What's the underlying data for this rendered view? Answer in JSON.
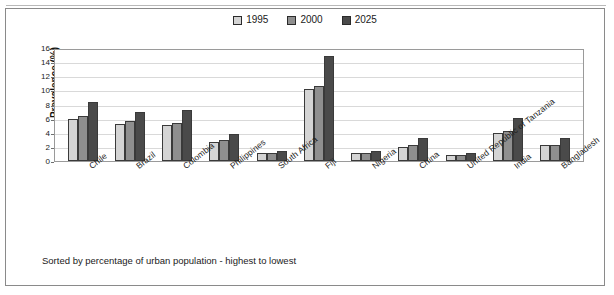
{
  "figure": {
    "caption": "Sorted by percentage of urban population - highest to lowest"
  },
  "legend": {
    "entries": [
      {
        "label": "1995",
        "color": "#d4d4d4"
      },
      {
        "label": "2000",
        "color": "#8f8f8f"
      },
      {
        "label": "2025",
        "color": "#4a4a4a"
      }
    ]
  },
  "chart_data": {
    "type": "bar",
    "title": "",
    "subtitle": "",
    "xlabel": "",
    "ylabel": "Prevalence (%)",
    "ylim": [
      0,
      16
    ],
    "ytick_step": 2,
    "yticks": [
      "0",
      "2",
      "4",
      "6",
      "8",
      "10",
      "12",
      "14",
      "16"
    ],
    "grid": true,
    "legend_position": "top-center",
    "annotations": [
      "Sorted by percentage of urban population - highest to lowest"
    ],
    "categories": [
      "Chile",
      "Brazil",
      "Colombia",
      "Philippines",
      "South Africa",
      "Fiji",
      "Nigeria",
      "China",
      "United Republic of Tanzania",
      "India",
      "Bangladesh"
    ],
    "series": [
      {
        "name": "1995",
        "color": "#d4d4d4",
        "values": [
          6.0,
          5.3,
          5.1,
          2.7,
          1.2,
          10.2,
          1.2,
          2.0,
          0.9,
          4.0,
          2.2
        ]
      },
      {
        "name": "2000",
        "color": "#8f8f8f",
        "values": [
          6.4,
          5.6,
          5.4,
          3.0,
          1.2,
          10.6,
          1.2,
          2.3,
          0.9,
          4.2,
          2.3
        ]
      },
      {
        "name": "2025",
        "color": "#4a4a4a",
        "values": [
          8.3,
          7.0,
          7.2,
          3.8,
          1.4,
          14.8,
          1.4,
          3.3,
          1.1,
          6.1,
          3.2
        ]
      }
    ]
  }
}
